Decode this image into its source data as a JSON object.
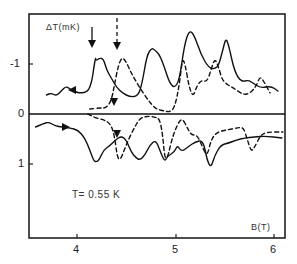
{
  "chart_data": {
    "type": "line",
    "title": "",
    "xlabel": "B(T)",
    "ylabel": "ΔT(mK)",
    "xlim": [
      3.53,
      6.11
    ],
    "ylim": [
      1.5,
      -2.0
    ],
    "y_inverted": true,
    "x_ticks": [
      "4",
      "5",
      "6"
    ],
    "y_ticks": [
      "-1",
      "0",
      "1"
    ],
    "grid": false,
    "annotation": "T= 0.55 K",
    "series": [
      {
        "name": "upper-solid (sweep down)",
        "style": "solid",
        "x": [
          3.69,
          3.74,
          3.79,
          3.84,
          3.89,
          3.94,
          3.99,
          4.03,
          4.11,
          4.15,
          4.17,
          4.19,
          4.19,
          4.23,
          4.27,
          4.3,
          4.36,
          4.4,
          4.46,
          4.54,
          4.62,
          4.66,
          4.71,
          4.76,
          4.79,
          4.84,
          4.89,
          4.94,
          4.99,
          5.04,
          5.09,
          5.14,
          5.19,
          5.26,
          5.34,
          5.4,
          5.44,
          5.48,
          5.51,
          5.54,
          5.6,
          5.67,
          5.74,
          5.8,
          5.87,
          5.97,
          6.04
        ],
        "y": [
          -0.38,
          -0.42,
          -0.36,
          -0.46,
          -0.56,
          -0.48,
          -0.44,
          -0.42,
          -0.44,
          -0.64,
          -0.92,
          -1.14,
          -1.06,
          -1.12,
          -1.1,
          -0.88,
          -0.68,
          -0.54,
          -0.42,
          -0.34,
          -0.36,
          -0.6,
          -1.18,
          -1.32,
          -1.28,
          -1.18,
          -0.92,
          -0.62,
          -0.52,
          -0.68,
          -1.38,
          -1.68,
          -1.58,
          -1.18,
          -0.92,
          -0.9,
          -0.98,
          -1.28,
          -1.52,
          -1.38,
          -0.84,
          -0.64,
          -0.68,
          -0.6,
          -0.52,
          -0.56,
          -0.46
        ]
      },
      {
        "name": "upper-dashed (sweep up)",
        "style": "dashed",
        "x": [
          4.13,
          4.23,
          4.3,
          4.35,
          4.38,
          4.42,
          4.46,
          4.5,
          4.56,
          4.64,
          4.72,
          4.79,
          4.84,
          4.89,
          4.94,
          4.99,
          5.04,
          5.07,
          5.1,
          5.14,
          5.18,
          5.22,
          5.27,
          5.32,
          5.36,
          5.4,
          5.44,
          5.48,
          5.59,
          5.69,
          5.76,
          5.82,
          5.86,
          5.9,
          5.96
        ],
        "y": [
          -0.1,
          -0.12,
          -0.12,
          -0.28,
          -0.58,
          -0.98,
          -1.14,
          -1.04,
          -0.78,
          -0.52,
          -0.28,
          -0.12,
          -0.08,
          -0.06,
          -0.04,
          -0.12,
          -0.58,
          -1.12,
          -0.98,
          -0.52,
          -0.34,
          -0.58,
          -0.68,
          -0.64,
          -0.88,
          -1.12,
          -0.92,
          -0.64,
          -0.52,
          -0.38,
          -0.42,
          -0.56,
          -0.76,
          -0.64,
          -0.42
        ]
      },
      {
        "name": "lower-solid (sweep up)",
        "style": "solid",
        "x": [
          3.58,
          3.65,
          3.71,
          3.78,
          3.85,
          3.93,
          4.01,
          4.08,
          4.13,
          4.17,
          4.2,
          4.23,
          4.27,
          4.33,
          4.39,
          4.45,
          4.5,
          4.55,
          4.6,
          4.64,
          4.69,
          4.74,
          4.8,
          4.84,
          4.89,
          4.92,
          4.99,
          5.02,
          5.06,
          5.14,
          5.2,
          5.28,
          5.32,
          5.36,
          5.4,
          5.46,
          5.54,
          5.62,
          5.7,
          5.8,
          5.91,
          6.08
        ],
        "y": [
          0.26,
          0.2,
          0.16,
          0.24,
          0.26,
          0.28,
          0.32,
          0.48,
          0.72,
          0.94,
          0.96,
          0.9,
          0.72,
          0.64,
          0.52,
          0.44,
          0.52,
          0.76,
          0.88,
          0.92,
          0.82,
          0.62,
          0.52,
          0.72,
          0.96,
          0.84,
          0.76,
          0.62,
          0.76,
          0.64,
          0.56,
          0.52,
          0.92,
          1.08,
          0.82,
          0.62,
          0.58,
          0.52,
          0.48,
          0.46,
          0.44,
          0.48
        ]
      },
      {
        "name": "lower-dashed (sweep down)",
        "style": "dashed",
        "x": [
          4.11,
          4.19,
          4.28,
          4.34,
          4.38,
          4.41,
          4.44,
          4.48,
          4.52,
          4.58,
          4.64,
          4.72,
          4.79,
          4.84,
          4.87,
          4.89,
          4.92,
          4.96,
          5.02,
          5.07,
          5.12,
          5.16,
          5.22,
          5.27,
          5.32,
          5.36,
          5.42,
          5.52,
          5.62,
          5.69,
          5.73,
          5.77,
          5.81,
          5.86,
          5.92,
          6.09
        ],
        "y": [
          0.0,
          0.08,
          0.12,
          0.2,
          0.42,
          0.88,
          0.92,
          0.72,
          0.52,
          0.28,
          0.08,
          0.04,
          0.06,
          0.1,
          0.42,
          0.88,
          0.88,
          0.52,
          0.2,
          0.08,
          0.28,
          0.42,
          0.42,
          0.64,
          0.86,
          0.52,
          0.36,
          0.32,
          0.28,
          0.26,
          0.52,
          0.76,
          0.64,
          0.44,
          0.36,
          0.36
        ]
      }
    ],
    "markers": [
      {
        "type": "solid-down-arrow",
        "x": 4.18,
        "y_label": "above peak"
      },
      {
        "type": "dashed-down-arrow",
        "x": 4.41,
        "y_label": "above peak"
      }
    ],
    "legend": null
  }
}
